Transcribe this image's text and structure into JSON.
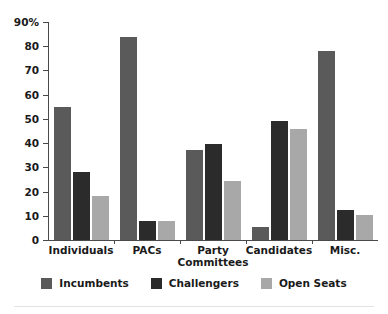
{
  "chart_data": {
    "type": "bar",
    "title": "",
    "xlabel": "",
    "ylabel": "",
    "ylim": [
      0,
      90
    ],
    "yticks": [
      0,
      10,
      20,
      30,
      40,
      50,
      60,
      70,
      80,
      90
    ],
    "ytick_labels": [
      "0",
      "10",
      "20",
      "30",
      "40",
      "50",
      "60",
      "70",
      "80",
      "90%"
    ],
    "grid": false,
    "legend_position": "bottom",
    "categories": [
      "Individuals",
      "PACs",
      "Party Committees",
      "Candidates",
      "Misc."
    ],
    "category_lines": [
      [
        "Individuals"
      ],
      [
        "PACs"
      ],
      [
        "Party",
        "Committees"
      ],
      [
        "Candidates"
      ],
      [
        "Misc."
      ]
    ],
    "series": [
      {
        "name": "Incumbents",
        "color": "#5a5a5a",
        "values": [
          55,
          84,
          37,
          5.5,
          78
        ]
      },
      {
        "name": "Challengers",
        "color": "#2b2b2b",
        "values": [
          28,
          8,
          39.5,
          49,
          12.5
        ]
      },
      {
        "name": "Open Seats",
        "color": "#a8a8a8",
        "values": [
          18,
          8,
          24.5,
          46,
          10.5
        ]
      }
    ]
  },
  "legend": {
    "items": [
      {
        "label": "Incumbents"
      },
      {
        "label": "Challengers"
      },
      {
        "label": "Open Seats"
      }
    ]
  }
}
